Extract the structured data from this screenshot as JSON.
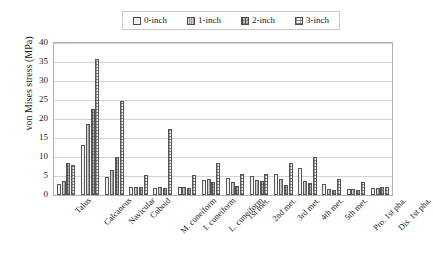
{
  "chart_data": {
    "type": "bar",
    "title": "",
    "xlabel": "",
    "ylabel": "von Mises stress (MPa)",
    "ylim": [
      0,
      40
    ],
    "ytick_step": 5,
    "yticks": [
      0,
      5,
      10,
      15,
      20,
      25,
      30,
      35,
      40
    ],
    "grid": true,
    "legend_position": "top-center",
    "categories": [
      "Talus",
      "Calcaneus",
      "Navicular",
      "Cuboid",
      "M. cuneiform",
      "I. cuneiform",
      "L. cuneiform",
      "1st met.",
      "2nd met.",
      "3rd met.",
      "4th met.",
      "5th met.",
      "Pro. 1st pha.",
      "Dis. 1st pha."
    ],
    "series": [
      {
        "name": "0-inch",
        "pattern": "empty",
        "values": [
          3.0,
          13.2,
          4.7,
          2.2,
          1.9,
          2.0,
          4.0,
          4.4,
          5.0,
          5.5,
          7.0,
          3.0,
          1.5,
          1.9
        ]
      },
      {
        "name": "1-inch",
        "pattern": "vertical-dense",
        "values": [
          3.6,
          18.7,
          6.6,
          2.2,
          2.0,
          2.1,
          4.1,
          3.4,
          4.0,
          4.2,
          3.6,
          1.6,
          1.6,
          1.9
        ]
      },
      {
        "name": "2-inch",
        "pattern": "grid-dark",
        "values": [
          8.4,
          22.6,
          10.0,
          2.1,
          1.8,
          1.9,
          3.3,
          2.4,
          3.6,
          2.6,
          3.2,
          1.4,
          1.3,
          2.0
        ]
      },
      {
        "name": "3-inch",
        "pattern": "horizontal-light",
        "values": [
          7.8,
          35.8,
          24.8,
          5.3,
          17.3,
          5.2,
          8.5,
          5.5,
          5.5,
          8.3,
          10.0,
          4.2,
          3.5,
          2.0
        ]
      }
    ]
  },
  "legend": {
    "items": [
      {
        "label": "0-inch"
      },
      {
        "label": "1-inch"
      },
      {
        "label": "2-inch"
      },
      {
        "label": "3-inch"
      }
    ]
  }
}
